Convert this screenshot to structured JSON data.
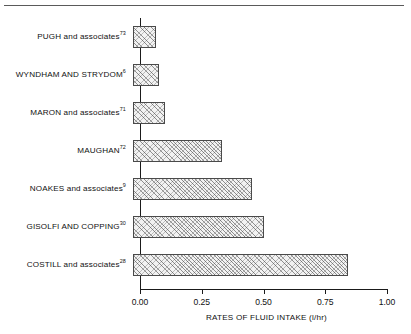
{
  "chart_data": {
    "type": "bar",
    "orientation": "horizontal",
    "title": "",
    "xlabel": "RATES OF FLUID INTAKE (l/hr)",
    "ylabel": "",
    "xlim": [
      0.0,
      1.0
    ],
    "xticks": [
      "0.00",
      "0.25",
      "0.50",
      "0.75",
      "1.00"
    ],
    "xtick_values": [
      0.0,
      0.25,
      0.5,
      0.75,
      1.0
    ],
    "grid": false,
    "legend": false,
    "bar_fill": "#f2f2f2",
    "bar_edge": "#4a4a4a",
    "bar_pattern": "diagonal-crosshatch",
    "categories": [
      "PUGH and associates",
      "WYNDHAM AND STRYDOM",
      "MARON and associates",
      "MAUGHAN",
      "NOAKES and associates",
      "GISOLFI AND COPPING",
      "COSTILL and associates"
    ],
    "references": [
      "73",
      "6",
      "71",
      "72",
      "9",
      "30",
      "28"
    ],
    "values": [
      0.095,
      0.105,
      0.13,
      0.36,
      0.48,
      0.53,
      0.87
    ],
    "bars": [
      {
        "label": "PUGH and associates",
        "ref": "73",
        "value": 0.095
      },
      {
        "label": "WYNDHAM AND STRYDOM",
        "ref": "6",
        "value": 0.105
      },
      {
        "label": "MARON and associates",
        "ref": "71",
        "value": 0.13
      },
      {
        "label": "MAUGHAN",
        "ref": "72",
        "value": 0.36
      },
      {
        "label": "NOAKES and associates",
        "ref": "9",
        "value": 0.48
      },
      {
        "label": "GISOLFI AND COPPING",
        "ref": "30",
        "value": 0.53
      },
      {
        "label": "COSTILL and associates",
        "ref": "28",
        "value": 0.87
      }
    ]
  }
}
